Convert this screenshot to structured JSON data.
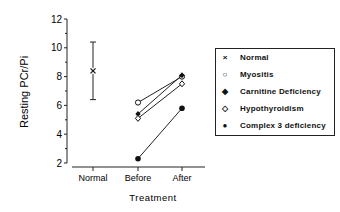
{
  "chart_data": {
    "type": "scatter",
    "title": "",
    "xlabel": "Treatment",
    "ylabel": "Resting PCr/Pi",
    "categories": [
      "Normal",
      "Before",
      "After"
    ],
    "ylim": [
      2,
      12
    ],
    "yticks": [
      2,
      4,
      6,
      8,
      10,
      12
    ],
    "grid": false,
    "legend_position": "right",
    "series": [
      {
        "name": "Normal",
        "marker": "x",
        "points": [
          {
            "x": "Normal",
            "y": 8.4,
            "error_low": 6.4,
            "error_high": 10.4
          }
        ]
      },
      {
        "name": "Myositis",
        "marker": "open-circle",
        "points": [
          {
            "x": "Before",
            "y": 6.2
          },
          {
            "x": "After",
            "y": 8.0
          }
        ]
      },
      {
        "name": "Carnitine Deficiency",
        "marker": "filled-diamond",
        "points": [
          {
            "x": "Before",
            "y": 5.4
          },
          {
            "x": "After",
            "y": 8.1
          }
        ]
      },
      {
        "name": "Hypothyroidism",
        "marker": "open-diamond",
        "points": [
          {
            "x": "Before",
            "y": 5.1
          },
          {
            "x": "After",
            "y": 7.5
          }
        ]
      },
      {
        "name": "Complex 3 deficiency",
        "marker": "filled-circle",
        "points": [
          {
            "x": "Before",
            "y": 2.3
          },
          {
            "x": "After",
            "y": 5.8
          }
        ]
      }
    ]
  },
  "legend": {
    "items": [
      {
        "marker": "×",
        "label": "Normal"
      },
      {
        "marker": "○",
        "label": "Myositis"
      },
      {
        "marker": "◆",
        "label": "Carnitine Deficiency"
      },
      {
        "marker": "◇",
        "label": "Hypothyroidism"
      },
      {
        "marker": "●",
        "label": "Complex 3 deficiency"
      }
    ]
  }
}
